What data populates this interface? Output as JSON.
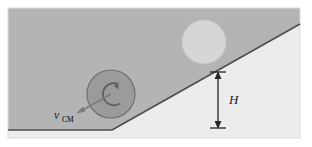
{
  "figure": {
    "kind": "physics-diagram",
    "panel": {
      "background_color": "#ffffff",
      "incline_body_color": "#b3b3b3",
      "lower_region_color": "#ebebeb",
      "panel_border_color": "#d9d9d9"
    },
    "incline": {
      "surface_line_color": "#4a4a4a",
      "ground_line_color": "#4a4a4a",
      "top_left_y": 10,
      "apex_x": 112,
      "apex_y": 130,
      "right_x": 300,
      "right_y": 24
    },
    "rolling_disk": {
      "name": "rolling disk at bottom",
      "fill_color": "#9a9a9a",
      "edge_color": "#6e6e6e",
      "center_x": 111,
      "center_y": 94,
      "radius": 24
    },
    "ghost_disk": {
      "name": "disk at top of incline",
      "fill_color": "#d5d5d5",
      "edge_color": "#c2c2c2",
      "center_x": 204,
      "center_y": 42,
      "radius": 22
    },
    "spin_arrow": {
      "name": "counterclockwise rotation arrow",
      "color": "#5e5e5e",
      "direction": "counterclockwise"
    },
    "velocity_vector": {
      "name": "center of mass velocity arrow",
      "color": "#7a7a7a",
      "from_x": 111,
      "from_y": 94,
      "to_x": 77,
      "to_y": 113
    },
    "height_dimension": {
      "line_x": 218,
      "top_y": 72,
      "bottom_y": 128,
      "color": "#262626"
    }
  },
  "labels": {
    "velocity_symbol": "v",
    "velocity_subscript": "CM",
    "height_symbol": "H"
  }
}
